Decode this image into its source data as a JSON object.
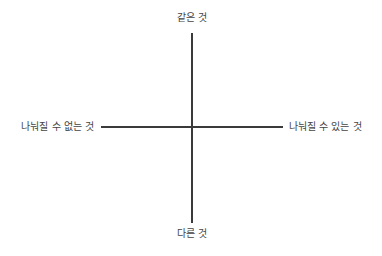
{
  "diagram": {
    "type": "quadrant-axes",
    "axes": {
      "vertical": {
        "top_label": "같은 것",
        "bottom_label": "다른 것"
      },
      "horizontal": {
        "left_label": "나눠질 수 없는 것",
        "right_label": "나눠질 수 있는 것"
      }
    },
    "colors": {
      "line": "#3a3a3a",
      "text": "#444444",
      "background": "#ffffff"
    }
  }
}
